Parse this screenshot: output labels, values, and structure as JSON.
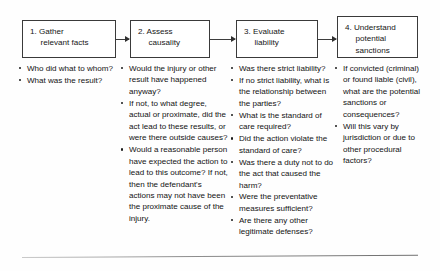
{
  "diagram": {
    "orientation": "left-to-right",
    "box_border_color": "#3a3a3a",
    "text_color": "#161616",
    "background": "#ffffff"
  },
  "steps": [
    {
      "number": "1.",
      "heading_line1": "1.  Gather",
      "heading_line2": "relevant facts",
      "bullets": [
        "Who did what to whom?",
        "What was the result?"
      ]
    },
    {
      "number": "2.",
      "heading_line1": "2.  Assess",
      "heading_line2": "causality",
      "bullets": [
        "Would the injury or other result have happened anyway?",
        "If not, to what degree, actual or proximate, did the act lead to these results, or were there outside causes?",
        "Would a reasonable person have expected the action to lead to this outcome? If not, then the defendant's actions may not have been the proximate cause of the injury."
      ]
    },
    {
      "number": "3.",
      "heading_line1": "3.  Evaluate",
      "heading_line2": "liability",
      "bullets": [
        "Was there strict liability?",
        "If no strict liability, what is the relationship between the parties?",
        "What is the standard of care required?",
        "Did the action violate the standard of care?",
        "Was there a duty not to do the act that caused the harm?",
        "Were the preventative measures sufficient?",
        "Are there any other legitimate defenses?"
      ]
    },
    {
      "number": "4.",
      "heading_line1": "4.  Understand",
      "heading_line2": "potential",
      "heading_line3": "sanctions",
      "bullets": [
        "If convicted (criminal) or found liable (civil), what are the potential sanctions or consequences?",
        "Will this vary by jurisdiction or due to other procedural factors?"
      ]
    }
  ],
  "arrows": [
    {
      "from": "step-1",
      "to": "step-2"
    },
    {
      "from": "step-2",
      "to": "step-3"
    },
    {
      "from": "step-3",
      "to": "step-4"
    }
  ]
}
